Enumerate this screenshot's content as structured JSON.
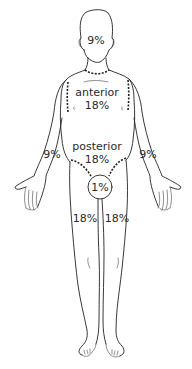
{
  "diagram": {
    "title": "",
    "regions": {
      "head": {
        "label": "9%"
      },
      "torso_anterior": {
        "name": "anterior",
        "label": "18%"
      },
      "torso_posterior": {
        "name": "posterior",
        "label": "18%"
      },
      "left_arm": {
        "label": "9%"
      },
      "right_arm": {
        "label": "9%"
      },
      "perineum": {
        "label": "1%"
      },
      "left_leg": {
        "label": "18%"
      },
      "right_leg": {
        "label": "18%"
      }
    },
    "colors": {
      "line": "#222222",
      "text": "#2a2a2a",
      "background": "#ffffff"
    }
  }
}
